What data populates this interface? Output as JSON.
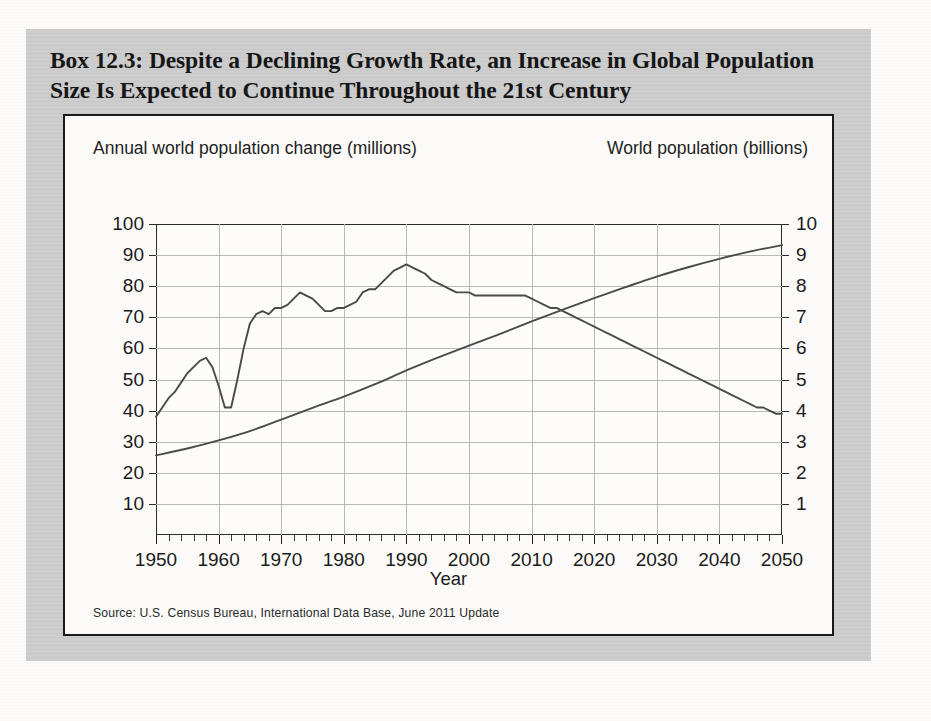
{
  "box": {
    "title": "Box 12.3: Despite a Declining Growth Rate, an Increase in Global Population Size Is Expected to Continue Throughout the 21st Century",
    "source": "Source: U.S. Census Bureau, International Data Base, June 2011 Update",
    "background_color": "#cccccc",
    "panel_color": "#fbfaf8",
    "line_color": "#4a4a4a"
  },
  "chart_data": {
    "type": "line",
    "title": "",
    "xlabel": "Year",
    "left_axis_label": "Annual world population change (millions)",
    "right_axis_label": "World population (billions)",
    "xlim": [
      1950,
      2050
    ],
    "xticks": [
      1950,
      1960,
      1970,
      1980,
      1990,
      2000,
      2010,
      2020,
      2030,
      2040,
      2050
    ],
    "xtick_labels": [
      "1950",
      "1960",
      "1970",
      "1980",
      "1990",
      "2000",
      "2010",
      "2020",
      "2030",
      "2040",
      "2050"
    ],
    "minor_xtick_step": 2,
    "left_ylim": [
      0,
      100
    ],
    "left_yticks": [
      10,
      20,
      30,
      40,
      50,
      60,
      70,
      80,
      90,
      100
    ],
    "left_ytick_labels": [
      "10",
      "20",
      "30",
      "40",
      "50",
      "60",
      "70",
      "80",
      "90",
      "100"
    ],
    "right_ylim": [
      0,
      10
    ],
    "right_yticks": [
      1,
      2,
      3,
      4,
      5,
      6,
      7,
      8,
      9,
      10
    ],
    "right_ytick_labels": [
      "1",
      "2",
      "3",
      "4",
      "5",
      "6",
      "7",
      "8",
      "9",
      "10"
    ],
    "grid": true,
    "legend": "none",
    "series": [
      {
        "name": "Annual world population change (millions)",
        "axis": "left",
        "x": [
          1950,
          1951,
          1952,
          1953,
          1954,
          1955,
          1956,
          1957,
          1958,
          1959,
          1960,
          1961,
          1962,
          1963,
          1964,
          1965,
          1966,
          1967,
          1968,
          1969,
          1970,
          1971,
          1972,
          1973,
          1974,
          1975,
          1976,
          1977,
          1978,
          1979,
          1980,
          1981,
          1982,
          1983,
          1984,
          1985,
          1986,
          1987,
          1988,
          1989,
          1990,
          1991,
          1992,
          1993,
          1994,
          1995,
          1996,
          1997,
          1998,
          1999,
          2000,
          2001,
          2002,
          2003,
          2004,
          2005,
          2006,
          2007,
          2008,
          2009,
          2010,
          2011,
          2012,
          2013,
          2014,
          2015,
          2016,
          2017,
          2018,
          2019,
          2020,
          2021,
          2022,
          2023,
          2024,
          2025,
          2026,
          2027,
          2028,
          2029,
          2030,
          2031,
          2032,
          2033,
          2034,
          2035,
          2036,
          2037,
          2038,
          2039,
          2040,
          2041,
          2042,
          2043,
          2044,
          2045,
          2046,
          2047,
          2048,
          2049,
          2050
        ],
        "y": [
          38,
          41,
          44,
          46,
          49,
          52,
          54,
          56,
          57,
          54,
          48,
          41,
          41,
          50,
          60,
          68,
          71,
          72,
          71,
          73,
          73,
          74,
          76,
          78,
          77,
          76,
          74,
          72,
          72,
          73,
          73,
          74,
          75,
          78,
          79,
          79,
          81,
          83,
          85,
          86,
          87,
          86,
          85,
          84,
          82,
          81,
          80,
          79,
          78,
          78,
          78,
          77,
          77,
          77,
          77,
          77,
          77,
          77,
          77,
          77,
          76,
          75,
          74,
          73,
          73,
          72,
          71,
          70,
          69,
          68,
          67,
          66,
          65,
          64,
          63,
          62,
          61,
          60,
          59,
          58,
          57,
          56,
          55,
          54,
          53,
          52,
          51,
          50,
          49,
          48,
          47,
          46,
          45,
          44,
          43,
          42,
          41,
          41,
          40,
          39,
          39
        ]
      },
      {
        "name": "World population (billions)",
        "axis": "right",
        "x": [
          1950,
          1955,
          1960,
          1965,
          1970,
          1975,
          1980,
          1985,
          1990,
          1995,
          2000,
          2005,
          2010,
          2015,
          2020,
          2025,
          2030,
          2035,
          2040,
          2045,
          2050
        ],
        "y": [
          2.56,
          2.78,
          3.04,
          3.34,
          3.71,
          4.09,
          4.45,
          4.85,
          5.29,
          5.7,
          6.09,
          6.47,
          6.87,
          7.25,
          7.62,
          7.97,
          8.31,
          8.61,
          8.88,
          9.12,
          9.32
        ]
      }
    ],
    "annotations": [
      {
        "label": "famine dip",
        "year": 1961,
        "left_value": 41
      },
      {
        "label": "peak annual increase",
        "year": 1989,
        "left_value": 87
      },
      {
        "label": "curve crossover",
        "year": 2015,
        "left_value": 72,
        "right_value": 7.25
      }
    ]
  }
}
